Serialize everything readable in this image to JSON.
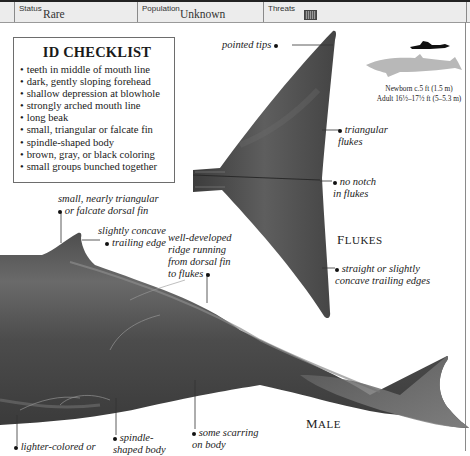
{
  "header": {
    "status_label": "Status",
    "status_value": "Rare",
    "population_label": "Population",
    "population_value": "Unknown",
    "threats_label": "Threats",
    "threats_icon": "fishing-net-icon"
  },
  "checklist": {
    "title": "ID CHECKLIST",
    "items": [
      "teeth in middle of mouth line",
      "dark, gently sloping forehead",
      "shallow depression at blowhole",
      "strongly arched mouth line",
      "long beak",
      "small, triangular or falcate fin",
      "spindle-shaped body",
      "brown, gray, or black coloring",
      "small groups bunched together"
    ]
  },
  "size_comparison": {
    "icons": [
      "swimmer-silhouette-icon",
      "whale-silhouette-icon"
    ],
    "newborn": "Newborn c.5 ft (1.5 m)",
    "adult": "Adult 16½–17½ ft (5–5.3 m)"
  },
  "flukes": {
    "caption_first": "F",
    "caption_rest": "LUKES",
    "notes": {
      "pointed_tips": "pointed tips",
      "triangular_1": "triangular",
      "triangular_2": "flukes",
      "no_notch_1": "no notch",
      "no_notch_2": "in flukes",
      "trailing_1": "straight or slightly",
      "trailing_2": "concave trailing edges"
    }
  },
  "male": {
    "caption_first": "M",
    "caption_rest": "ALE",
    "notes": {
      "dorsal_1": "small, nearly triangular",
      "dorsal_2": "or falcate dorsal fin",
      "concave_1": "slightly concave",
      "concave_2": "trailing edge",
      "ridge_1": "well-developed",
      "ridge_2": "ridge running",
      "ridge_3": "from dorsal fin",
      "ridge_4": "to flukes",
      "lighter": "lighter-colored or",
      "spindle_1": "spindle-",
      "spindle_2": "shaped body",
      "scarring_1": "some scarring",
      "scarring_2": "on body"
    }
  },
  "colors": {
    "header_bg": "#ececec",
    "whale_dark": "#4a4a4a",
    "whale_mid": "#6e6e6e",
    "silhouette_gray": "#b5b5b5"
  }
}
